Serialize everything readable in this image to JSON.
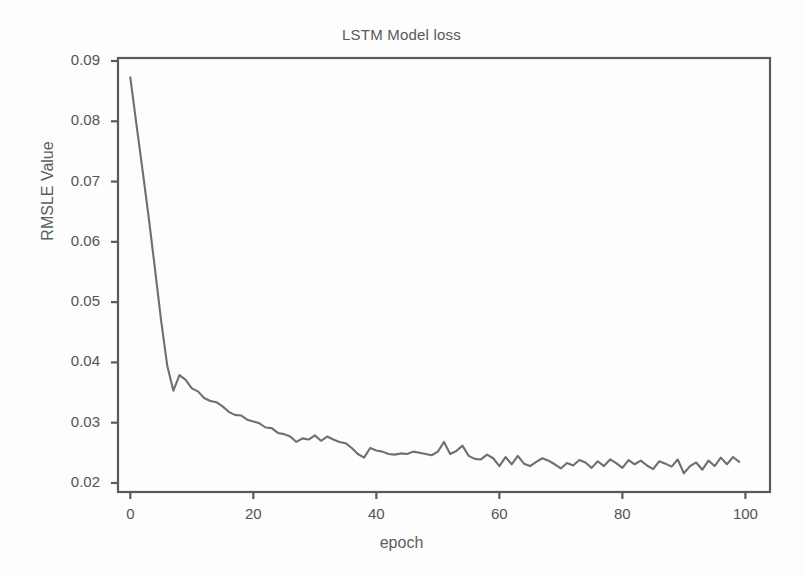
{
  "chart_data": {
    "type": "line",
    "title": "LSTM Model loss",
    "xlabel": "epoch",
    "ylabel": "RMSLE Value",
    "xlim": [
      -2,
      104
    ],
    "ylim": [
      0.0185,
      0.0905
    ],
    "xticks": [
      0,
      20,
      40,
      60,
      80,
      100
    ],
    "xtick_labels": [
      "0",
      "20",
      "40",
      "60",
      "80",
      "100"
    ],
    "yticks": [
      0.02,
      0.03,
      0.04,
      0.05,
      0.06,
      0.07,
      0.08,
      0.09
    ],
    "ytick_labels": [
      "0.02",
      "0.03",
      "0.04",
      "0.05",
      "0.06",
      "0.07",
      "0.08",
      "0.09"
    ],
    "grid": false,
    "legend": null,
    "line_color": "#6f6f6f",
    "frame_color": "#5a5a5a",
    "series": [
      {
        "name": "train loss",
        "x": [
          0,
          1,
          2,
          3,
          4,
          5,
          6,
          7,
          8,
          9,
          10,
          11,
          12,
          13,
          14,
          15,
          16,
          17,
          18,
          19,
          20,
          21,
          22,
          23,
          24,
          25,
          26,
          27,
          28,
          29,
          30,
          31,
          32,
          33,
          34,
          35,
          36,
          37,
          38,
          39,
          40,
          41,
          42,
          43,
          44,
          45,
          46,
          47,
          48,
          49,
          50,
          51,
          52,
          53,
          54,
          55,
          56,
          57,
          58,
          59,
          60,
          61,
          62,
          63,
          64,
          65,
          66,
          67,
          68,
          69,
          70,
          71,
          72,
          73,
          74,
          75,
          76,
          77,
          78,
          79,
          80,
          81,
          82,
          83,
          84,
          85,
          86,
          87,
          88,
          89,
          90,
          91,
          92,
          93,
          94,
          95,
          96,
          97,
          98,
          99
        ],
        "y": [
          0.0873,
          0.0795,
          0.0718,
          0.064,
          0.0556,
          0.047,
          0.0395,
          0.0353,
          0.0379,
          0.0371,
          0.0357,
          0.0352,
          0.0341,
          0.0336,
          0.0334,
          0.0327,
          0.0318,
          0.0313,
          0.0312,
          0.0305,
          0.0302,
          0.0299,
          0.0292,
          0.0291,
          0.0283,
          0.0281,
          0.0277,
          0.0268,
          0.0274,
          0.0272,
          0.0279,
          0.027,
          0.0277,
          0.0272,
          0.0268,
          0.0266,
          0.0258,
          0.0248,
          0.0242,
          0.0258,
          0.0254,
          0.0252,
          0.0248,
          0.0247,
          0.0249,
          0.0248,
          0.0252,
          0.025,
          0.0248,
          0.0246,
          0.0252,
          0.0268,
          0.0248,
          0.0253,
          0.0262,
          0.0245,
          0.024,
          0.0239,
          0.0247,
          0.0241,
          0.0228,
          0.0243,
          0.0231,
          0.0245,
          0.0232,
          0.0228,
          0.0235,
          0.0241,
          0.0237,
          0.0231,
          0.0224,
          0.0233,
          0.0229,
          0.0238,
          0.0234,
          0.0225,
          0.0236,
          0.0228,
          0.0239,
          0.0233,
          0.0225,
          0.0238,
          0.0231,
          0.0237,
          0.0229,
          0.0223,
          0.0236,
          0.0232,
          0.0227,
          0.0239,
          0.0216,
          0.0228,
          0.0234,
          0.0222,
          0.0237,
          0.0228,
          0.0242,
          0.0231,
          0.0243,
          0.0235
        ]
      }
    ]
  }
}
